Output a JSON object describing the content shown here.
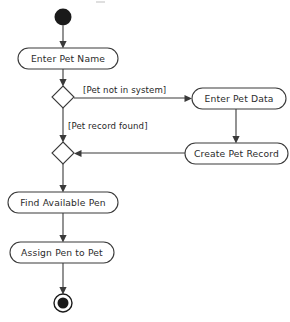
{
  "diagram": {
    "type": "uml-activity-diagram",
    "canvas": {
      "width": 290,
      "height": 322
    },
    "colors": {
      "background": "#ffffff",
      "stroke": "#3a3a3a",
      "node_fill": "#ffffff",
      "text": "#2b2b2b",
      "terminal_fill": "#1a1a1a"
    },
    "nodes": [
      {
        "id": "start",
        "kind": "initial-node",
        "label": "",
        "cx": 63,
        "cy": 17,
        "r": 8.5
      },
      {
        "id": "enter-pet-name",
        "kind": "action",
        "label": "Enter Pet Name",
        "x": 18,
        "y": 48,
        "w": 100,
        "h": 21
      },
      {
        "id": "decision-pet-known",
        "kind": "decision",
        "label": "",
        "cx": 63,
        "cy": 97,
        "rx": 11,
        "ry": 11
      },
      {
        "id": "enter-pet-data",
        "kind": "action",
        "label": "Enter Pet Data",
        "x": 192,
        "y": 88,
        "w": 94,
        "h": 21
      },
      {
        "id": "create-pet-record",
        "kind": "action",
        "label": "Create Pet Record",
        "x": 185,
        "y": 143,
        "w": 103,
        "h": 21
      },
      {
        "id": "merge-node",
        "kind": "merge",
        "label": "",
        "cx": 63,
        "cy": 153,
        "rx": 11,
        "ry": 11
      },
      {
        "id": "find-available-pen",
        "kind": "action",
        "label": "Find Available Pen",
        "x": 8,
        "y": 192,
        "w": 110,
        "h": 21
      },
      {
        "id": "assign-pen-to-pet",
        "kind": "action",
        "label": "Assign Pen to Pet",
        "x": 10,
        "y": 242,
        "w": 104,
        "h": 21
      },
      {
        "id": "end",
        "kind": "final-node",
        "label": "",
        "cx": 63,
        "cy": 303,
        "r_outer": 9,
        "r_inner": 5.5
      }
    ],
    "edges": [
      {
        "id": "e1",
        "from": "start",
        "to": "enter-pet-name",
        "guard": ""
      },
      {
        "id": "e2",
        "from": "enter-pet-name",
        "to": "decision-pet-known",
        "guard": ""
      },
      {
        "id": "e3",
        "from": "decision-pet-known",
        "to": "enter-pet-data",
        "guard": "[Pet not in system]"
      },
      {
        "id": "e4",
        "from": "decision-pet-known",
        "to": "merge-node",
        "guard": "[Pet record found]"
      },
      {
        "id": "e5",
        "from": "enter-pet-data",
        "to": "create-pet-record",
        "guard": ""
      },
      {
        "id": "e6",
        "from": "create-pet-record",
        "to": "merge-node",
        "guard": ""
      },
      {
        "id": "e7",
        "from": "merge-node",
        "to": "find-available-pen",
        "guard": ""
      },
      {
        "id": "e8",
        "from": "find-available-pen",
        "to": "assign-pen-to-pet",
        "guard": ""
      },
      {
        "id": "e9",
        "from": "assign-pen-to-pet",
        "to": "end",
        "guard": ""
      }
    ],
    "guards": {
      "pet_not_in_system": "[Pet not in system]",
      "pet_record_found": "[Pet record found]"
    },
    "labels": {
      "enter_pet_name": "Enter Pet Name",
      "enter_pet_data": "Enter Pet Data",
      "create_pet_record": "Create Pet Record",
      "find_available_pen": "Find Available Pen",
      "assign_pen_to_pet": "Assign Pen to Pet"
    }
  }
}
